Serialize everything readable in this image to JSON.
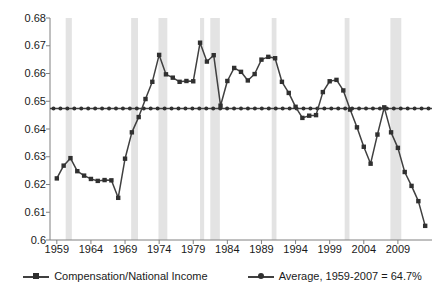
{
  "chart_data": {
    "type": "line",
    "title": "",
    "subtitle": "",
    "xlabel": "",
    "ylabel": "",
    "xlim": [
      1958,
      2014
    ],
    "ylim": [
      0.6,
      0.68
    ],
    "ytick_labels": [
      "0.68",
      "0.67",
      "0.66",
      "0.65",
      "0.64",
      "0.63",
      "0.62",
      "0.61",
      "0.6"
    ],
    "ytick_values": [
      0.68,
      0.67,
      0.66,
      0.65,
      0.64,
      0.63,
      0.62,
      0.61,
      0.6
    ],
    "xtick_labels": [
      "1959",
      "1964",
      "1969",
      "1974",
      "1979",
      "1984",
      "1989",
      "1994",
      "1999",
      "2004",
      "2009"
    ],
    "xtick_values": [
      1959,
      1964,
      1969,
      1974,
      1979,
      1984,
      1989,
      1994,
      1999,
      2004,
      2009
    ],
    "grid": false,
    "legend_position": "bottom",
    "line_color": "#404040",
    "marker_color": "#303030",
    "recession_band_color": "#e3e3e3",
    "axis_color": "#808080",
    "x": [
      1959,
      1960,
      1961,
      1962,
      1963,
      1964,
      1965,
      1966,
      1967,
      1968,
      1969,
      1970,
      1971,
      1972,
      1973,
      1974,
      1975,
      1976,
      1977,
      1978,
      1979,
      1980,
      1981,
      1982,
      1983,
      1984,
      1985,
      1986,
      1987,
      1988,
      1989,
      1990,
      1991,
      1992,
      1993,
      1994,
      1995,
      1996,
      1997,
      1998,
      1999,
      2000,
      2001,
      2002,
      2003,
      2004,
      2005,
      2006,
      2007,
      2008,
      2009,
      2010,
      2011,
      2012,
      2013
    ],
    "series": [
      {
        "name": "Compensation/National Income",
        "marker": "square",
        "values": [
          0.6222,
          0.6268,
          0.6295,
          0.6248,
          0.6232,
          0.622,
          0.6213,
          0.6216,
          0.6215,
          0.6152,
          0.6293,
          0.6388,
          0.6443,
          0.6508,
          0.657,
          0.6667,
          0.6597,
          0.6585,
          0.657,
          0.6573,
          0.6572,
          0.6711,
          0.6643,
          0.6666,
          0.6484,
          0.6573,
          0.662,
          0.6606,
          0.6575,
          0.6598,
          0.665,
          0.666,
          0.6655,
          0.657,
          0.653,
          0.648,
          0.644,
          0.6448,
          0.645,
          0.6533,
          0.6572,
          0.6577,
          0.6539,
          0.647,
          0.6406,
          0.6336,
          0.6275,
          0.638,
          0.6478,
          0.6388,
          0.6332,
          0.6245,
          0.6195,
          0.614,
          0.6051
        ]
      },
      {
        "name": "Average, 1959-2007 = 64.7%",
        "marker": "round",
        "constant_value": 0.6474
      }
    ],
    "legend": [
      {
        "label": "Compensation/National Income",
        "marker": "square"
      },
      {
        "label": "Average, 1959-2007 = 64.7%",
        "marker": "round"
      }
    ],
    "recession_bands": [
      {
        "start": 1960.3,
        "end": 1961.2
      },
      {
        "start": 1969.9,
        "end": 1970.9
      },
      {
        "start": 1973.9,
        "end": 1975.2
      },
      {
        "start": 1980.0,
        "end": 1980.6
      },
      {
        "start": 1981.5,
        "end": 1982.9
      },
      {
        "start": 1990.5,
        "end": 1991.2
      },
      {
        "start": 2001.2,
        "end": 2001.9
      },
      {
        "start": 2007.9,
        "end": 2009.5
      }
    ]
  }
}
